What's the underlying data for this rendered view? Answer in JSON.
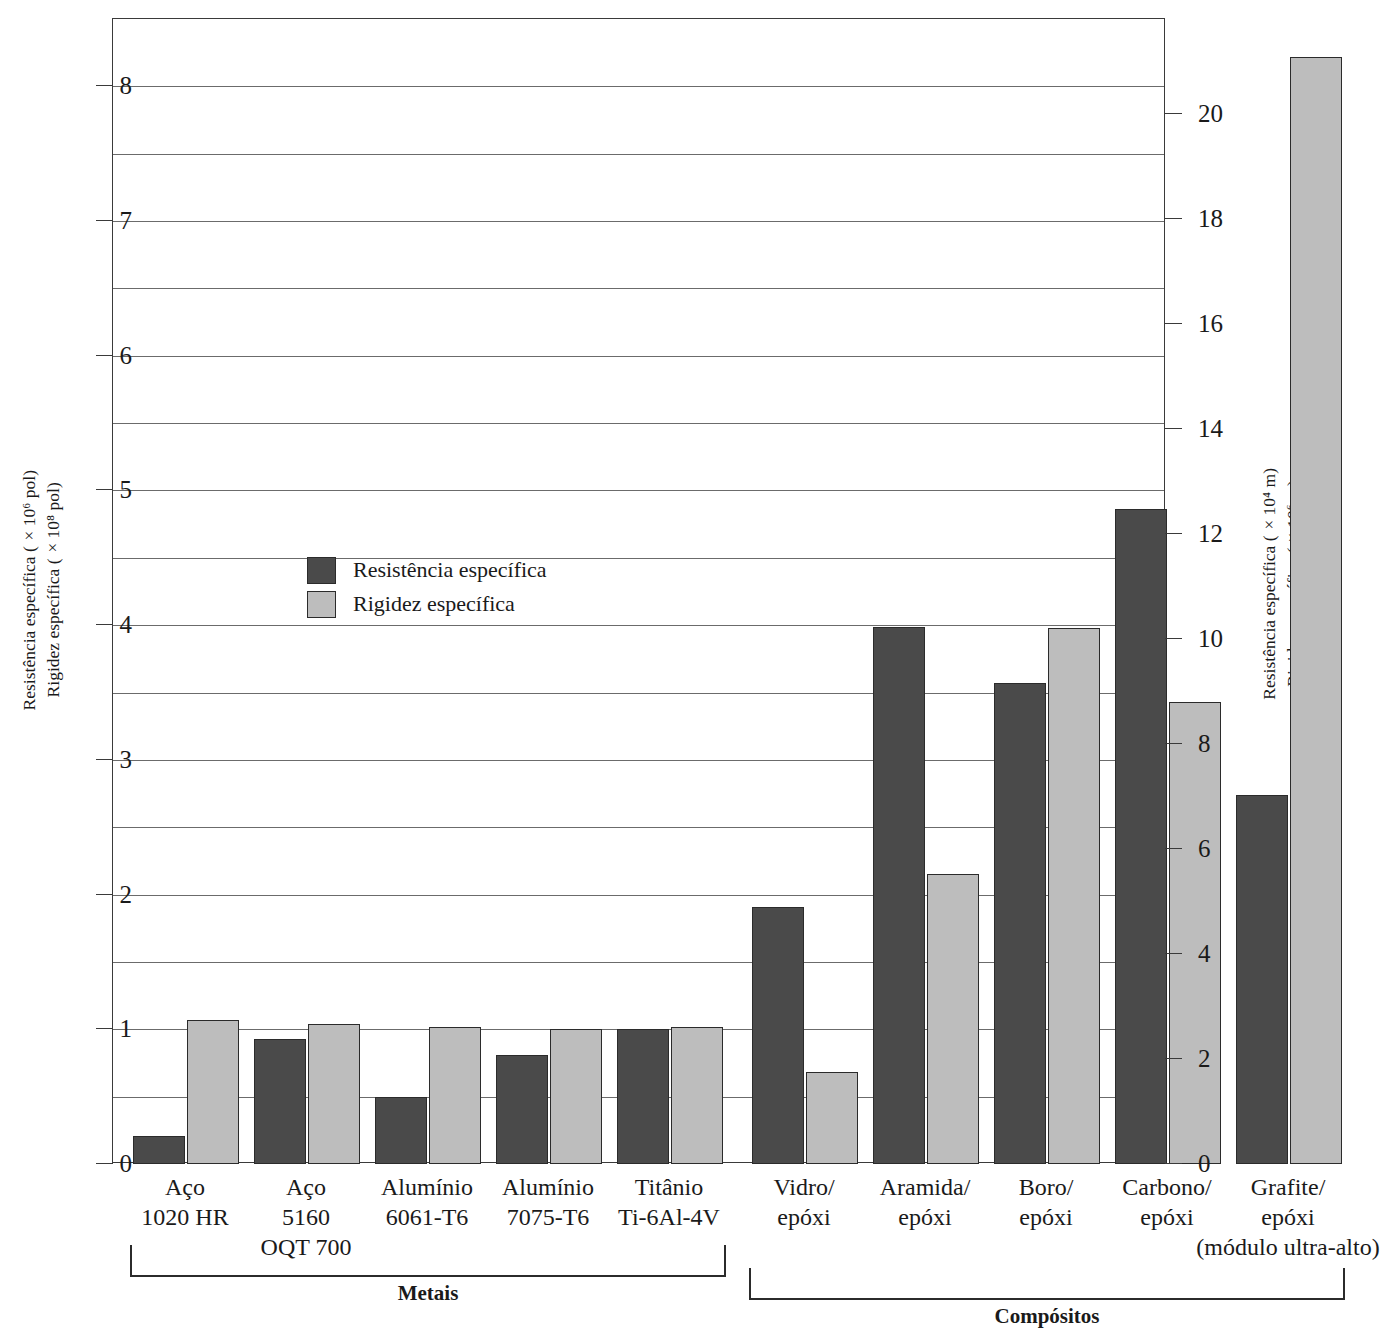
{
  "chart_data": {
    "type": "bar",
    "title": "",
    "categories": [
      "Aço 1020 HR",
      "Aço 5160 OQT 700",
      "Alumínio 6061-T6",
      "Alumínio 7075-T6",
      "Titânio Ti-6Al-4V",
      "Vidro/epóxi",
      "Aramida/epóxi",
      "Boro/epóxi",
      "Carbono/epóxi",
      "Grafite/epóxi (módulo ultra-alto)"
    ],
    "series": [
      {
        "name": "Resistência específica",
        "color": "#4a4a4a",
        "values": [
          0.21,
          0.93,
          0.5,
          0.81,
          1.0,
          1.91,
          3.99,
          3.57,
          4.86,
          2.74
        ]
      },
      {
        "name": "Rigidez específica",
        "color": "#bdbdbd",
        "values": [
          1.07,
          1.04,
          1.02,
          1.0,
          1.02,
          0.68,
          2.15,
          3.98,
          3.43,
          8.22
        ]
      }
    ],
    "xlabel": "",
    "ylabel": "Resistência específica (×10⁶ pol) / Rigidez específica (×10⁸ pol)",
    "ylim": [
      0,
      8.5
    ],
    "ylim_right": [
      0,
      21.8
    ],
    "grid": true,
    "grid_step": 0.5,
    "legend_position": "inside-upper-left"
  },
  "axes": {
    "left": {
      "title_line1": "Resistência específica (×10⁶ pol)",
      "title_line2": "Rigidez específica (×10⁸ pol)",
      "ticks": [
        {
          "value": 0,
          "label": "0"
        },
        {
          "value": 1,
          "label": "1"
        },
        {
          "value": 2,
          "label": "2"
        },
        {
          "value": 3,
          "label": "3"
        },
        {
          "value": 4,
          "label": "4"
        },
        {
          "value": 5,
          "label": "5"
        },
        {
          "value": 6,
          "label": "6"
        },
        {
          "value": 7,
          "label": "7"
        },
        {
          "value": 8,
          "label": "8"
        }
      ]
    },
    "right": {
      "title_line1": "Resistência específica (×10⁴ m)",
      "title_line2": "Rigidez específica (×10⁶ m)",
      "ticks": [
        {
          "value": 0,
          "label": "0"
        },
        {
          "value": 2,
          "label": "2"
        },
        {
          "value": 4,
          "label": "4"
        },
        {
          "value": 6,
          "label": "6"
        },
        {
          "value": 8,
          "label": "8"
        },
        {
          "value": 10,
          "label": "10"
        },
        {
          "value": 12,
          "label": "12"
        },
        {
          "value": 14,
          "label": "14"
        },
        {
          "value": 16,
          "label": "16"
        },
        {
          "value": 18,
          "label": "18"
        },
        {
          "value": 20,
          "label": "20"
        }
      ]
    }
  },
  "legend": {
    "items": [
      {
        "label": "Resistência específica",
        "swatch": "strength"
      },
      {
        "label": "Rigidez específica",
        "swatch": "stiffness"
      }
    ]
  },
  "category_labels": [
    {
      "line1": "Aço",
      "line2": "1020 HR",
      "line3": ""
    },
    {
      "line1": "Aço",
      "line2": "5160",
      "line3": "OQT 700"
    },
    {
      "line1": "Alumínio",
      "line2": "6061-T6",
      "line3": ""
    },
    {
      "line1": "Alumínio",
      "line2": "7075-T6",
      "line3": ""
    },
    {
      "line1": "Titânio",
      "line2": "Ti-6Al-4V",
      "line3": ""
    },
    {
      "line1": "Vidro/",
      "line2": "epóxi",
      "line3": ""
    },
    {
      "line1": "Aramida/",
      "line2": "epóxi",
      "line3": ""
    },
    {
      "line1": "Boro/",
      "line2": "epóxi",
      "line3": ""
    },
    {
      "line1": "Carbono/",
      "line2": "epóxi",
      "line3": ""
    },
    {
      "line1": "Grafite/",
      "line2": "epóxi",
      "line3": "(módulo ultra-alto)"
    }
  ],
  "groups": [
    {
      "label": "Metais",
      "first": 0,
      "last": 4
    },
    {
      "label": "Compósitos",
      "first": 5,
      "last": 9
    }
  ]
}
